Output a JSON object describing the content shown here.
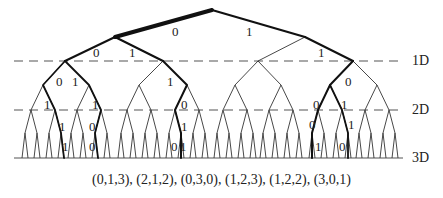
{
  "diagram": {
    "type": "binary-tree",
    "levels": [
      {
        "label": "1D",
        "y": 61
      },
      {
        "label": "2D",
        "y": 110
      },
      {
        "label": "3D",
        "y": 158
      }
    ],
    "edge_labels": [
      {
        "text": "0",
        "x": 172,
        "y": 25
      },
      {
        "text": "1",
        "x": 246,
        "y": 25
      },
      {
        "text": "0",
        "x": 93,
        "y": 46
      },
      {
        "text": "1",
        "x": 129,
        "y": 46
      },
      {
        "text": "1",
        "x": 318,
        "y": 46
      },
      {
        "text": "0",
        "x": 56,
        "y": 75
      },
      {
        "text": "1",
        "x": 72,
        "y": 75
      },
      {
        "text": "1",
        "x": 167,
        "y": 75
      },
      {
        "text": "0",
        "x": 345,
        "y": 75
      },
      {
        "text": "1",
        "x": 44,
        "y": 98
      },
      {
        "text": "1",
        "x": 92,
        "y": 98
      },
      {
        "text": "0",
        "x": 181,
        "y": 98
      },
      {
        "text": "0",
        "x": 313,
        "y": 98
      },
      {
        "text": "1",
        "x": 341,
        "y": 98
      },
      {
        "text": "1",
        "x": 59,
        "y": 120
      },
      {
        "text": "0",
        "x": 89,
        "y": 120
      },
      {
        "text": "1",
        "x": 181,
        "y": 120
      },
      {
        "text": "0",
        "x": 309,
        "y": 118
      },
      {
        "text": "1",
        "x": 348,
        "y": 118
      },
      {
        "text": "1",
        "x": 62,
        "y": 140
      },
      {
        "text": "0",
        "x": 89,
        "y": 140
      },
      {
        "text": "0",
        "x": 171,
        "y": 140
      },
      {
        "text": "1",
        "x": 180,
        "y": 140
      },
      {
        "text": "1",
        "x": 315,
        "y": 140
      },
      {
        "text": "0",
        "x": 339,
        "y": 140
      }
    ],
    "caption": "(0,1,3), (2,1,2), (0,3,0), (1,2,3), (1,2,2), (3,0,1)"
  }
}
